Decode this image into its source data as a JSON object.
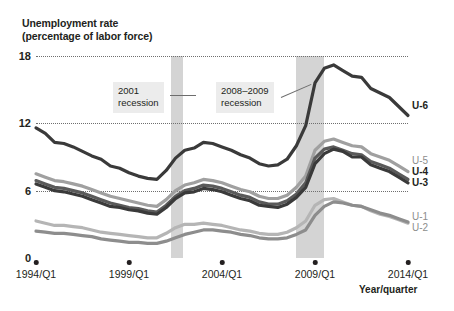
{
  "chart_data": {
    "type": "line",
    "title": "Unemployment rate",
    "subtitle": "(percentage of labor force)",
    "xlabel": "Year/quarter",
    "ylabel": "",
    "ylim": [
      0,
      18
    ],
    "yticks": [
      0,
      6,
      12,
      18
    ],
    "ytick_labels": [
      "0",
      "6",
      "12",
      "18"
    ],
    "grid": "horizontal-dotted",
    "legend_position": "right-inline",
    "xlim": [
      "1994/Q1",
      "2014/Q1"
    ],
    "xticks": [
      "1994/Q1",
      "1999/Q1",
      "2004/Q1",
      "2009/Q1",
      "2014/Q1"
    ],
    "x_start_year": 1994.0,
    "x_end_year": 2014.0,
    "annotations": [
      {
        "label_line1": "2001",
        "label_line2": "recession",
        "points_to": "2001 recession band"
      },
      {
        "label_line1": "2008–2009",
        "label_line2": "recession",
        "points_to": "2008-2009 recession band"
      }
    ],
    "recession_bands": [
      {
        "name": "2001 recession",
        "start_year": 2001.25,
        "end_year": 2001.9,
        "color": "#d4d4d4"
      },
      {
        "name": "2008-2009 recession",
        "start_year": 2008.0,
        "end_year": 2009.5,
        "color": "#d4d4d4"
      }
    ],
    "series": [
      {
        "name": "U-6",
        "label": "U-6",
        "color": "#3a3a3a",
        "label_style": "bold",
        "x": [
          1994.0,
          1994.5,
          1995.0,
          1995.5,
          1996.0,
          1996.5,
          1997.0,
          1997.5,
          1998.0,
          1998.5,
          1999.0,
          1999.5,
          2000.0,
          2000.5,
          2001.0,
          2001.5,
          2002.0,
          2002.5,
          2003.0,
          2003.5,
          2004.0,
          2004.5,
          2005.0,
          2005.5,
          2006.0,
          2006.5,
          2007.0,
          2007.5,
          2008.0,
          2008.5,
          2009.0,
          2009.5,
          2010.0,
          2010.5,
          2011.0,
          2011.5,
          2012.0,
          2012.5,
          2013.0,
          2013.5,
          2014.0
        ],
        "values": [
          11.6,
          11.1,
          10.3,
          10.2,
          9.9,
          9.5,
          9.1,
          8.8,
          8.2,
          8.0,
          7.6,
          7.3,
          7.1,
          7.0,
          7.8,
          8.9,
          9.6,
          9.8,
          10.3,
          10.2,
          9.9,
          9.6,
          9.2,
          8.9,
          8.4,
          8.2,
          8.3,
          8.8,
          10.0,
          11.8,
          15.6,
          16.9,
          17.2,
          16.7,
          16.2,
          16.1,
          15.1,
          14.7,
          14.3,
          13.5,
          12.7
        ],
        "endpoint_value": 12.6,
        "peak_value": 17.2,
        "peak_x": "2010/Q1",
        "min_value": 6.9
      },
      {
        "name": "U-5",
        "label": "U-5",
        "color": "#a0a0a0",
        "label_style": "gray",
        "x": [
          1994.0,
          1994.5,
          1995.0,
          1995.5,
          1996.0,
          1996.5,
          1997.0,
          1997.5,
          1998.0,
          1998.5,
          1999.0,
          1999.5,
          2000.0,
          2000.5,
          2001.0,
          2001.5,
          2002.0,
          2002.5,
          2003.0,
          2003.5,
          2004.0,
          2004.5,
          2005.0,
          2005.5,
          2006.0,
          2006.5,
          2007.0,
          2007.5,
          2008.0,
          2008.5,
          2009.0,
          2009.5,
          2010.0,
          2010.5,
          2011.0,
          2011.5,
          2012.0,
          2012.5,
          2013.0,
          2013.5,
          2014.0
        ],
        "values": [
          7.5,
          7.2,
          6.9,
          6.8,
          6.6,
          6.4,
          6.1,
          5.8,
          5.5,
          5.3,
          5.1,
          4.9,
          4.7,
          4.6,
          5.2,
          6.0,
          6.5,
          6.7,
          7.0,
          6.9,
          6.7,
          6.4,
          6.1,
          5.9,
          5.5,
          5.3,
          5.3,
          5.6,
          6.3,
          7.3,
          9.6,
          10.4,
          10.6,
          10.3,
          10.0,
          9.9,
          9.3,
          9.0,
          8.7,
          8.2,
          7.7
        ],
        "endpoint_value": 7.4
      },
      {
        "name": "U-4",
        "label": "U-4",
        "color": "#5a5a5a",
        "label_style": "bold",
        "x": [
          1994.0,
          1994.5,
          1995.0,
          1995.5,
          1996.0,
          1996.5,
          1997.0,
          1997.5,
          1998.0,
          1998.5,
          1999.0,
          1999.5,
          2000.0,
          2000.5,
          2001.0,
          2001.5,
          2002.0,
          2002.5,
          2003.0,
          2003.5,
          2004.0,
          2004.5,
          2005.0,
          2005.5,
          2006.0,
          2006.5,
          2007.0,
          2007.5,
          2008.0,
          2008.5,
          2009.0,
          2009.5,
          2010.0,
          2010.5,
          2011.0,
          2011.5,
          2012.0,
          2012.5,
          2013.0,
          2013.5,
          2014.0
        ],
        "values": [
          6.9,
          6.6,
          6.3,
          6.2,
          6.0,
          5.8,
          5.5,
          5.2,
          4.9,
          4.7,
          4.5,
          4.4,
          4.2,
          4.1,
          4.7,
          5.5,
          6.0,
          6.2,
          6.5,
          6.4,
          6.2,
          5.9,
          5.6,
          5.4,
          5.0,
          4.8,
          4.8,
          5.1,
          5.7,
          6.7,
          8.9,
          9.7,
          9.9,
          9.6,
          9.3,
          9.2,
          8.6,
          8.3,
          8.0,
          7.5,
          7.0
        ],
        "endpoint_value": 6.7
      },
      {
        "name": "U-3",
        "label": "U-3",
        "color": "#3a3a3a",
        "label_style": "bold",
        "x": [
          1994.0,
          1994.5,
          1995.0,
          1995.5,
          1996.0,
          1996.5,
          1997.0,
          1997.5,
          1998.0,
          1998.5,
          1999.0,
          1999.5,
          2000.0,
          2000.5,
          2001.0,
          2001.5,
          2002.0,
          2002.5,
          2003.0,
          2003.5,
          2004.0,
          2004.5,
          2005.0,
          2005.5,
          2006.0,
          2006.5,
          2007.0,
          2007.5,
          2008.0,
          2008.5,
          2009.0,
          2009.5,
          2010.0,
          2010.5,
          2011.0,
          2011.5,
          2012.0,
          2012.5,
          2013.0,
          2013.5,
          2014.0
        ],
        "values": [
          6.6,
          6.3,
          6.0,
          5.9,
          5.7,
          5.5,
          5.2,
          4.9,
          4.6,
          4.5,
          4.3,
          4.2,
          4.0,
          3.9,
          4.5,
          5.3,
          5.8,
          5.9,
          6.2,
          6.1,
          5.9,
          5.6,
          5.3,
          5.1,
          4.7,
          4.6,
          4.5,
          4.8,
          5.4,
          6.3,
          8.4,
          9.3,
          9.7,
          9.5,
          9.0,
          9.0,
          8.3,
          8.0,
          7.7,
          7.2,
          6.7
        ],
        "endpoint_value": 6.3
      },
      {
        "name": "U-1",
        "label": "U-1",
        "color": "#8d8d8d",
        "label_style": "gray",
        "x": [
          1994.0,
          1994.5,
          1995.0,
          1995.5,
          1996.0,
          1996.5,
          1997.0,
          1997.5,
          1998.0,
          1998.5,
          1999.0,
          1999.5,
          2000.0,
          2000.5,
          2001.0,
          2001.5,
          2002.0,
          2002.5,
          2003.0,
          2003.5,
          2004.0,
          2004.5,
          2005.0,
          2005.5,
          2006.0,
          2006.5,
          2007.0,
          2007.5,
          2008.0,
          2008.5,
          2009.0,
          2009.5,
          2010.0,
          2010.5,
          2011.0,
          2011.5,
          2012.0,
          2012.5,
          2013.0,
          2013.5,
          2014.0
        ],
        "values": [
          2.4,
          2.3,
          2.2,
          2.2,
          2.1,
          2.0,
          1.9,
          1.7,
          1.6,
          1.5,
          1.4,
          1.4,
          1.3,
          1.3,
          1.5,
          1.8,
          2.1,
          2.3,
          2.5,
          2.5,
          2.4,
          2.3,
          2.1,
          2.0,
          1.8,
          1.7,
          1.7,
          1.8,
          2.1,
          2.5,
          3.8,
          4.6,
          5.0,
          4.9,
          4.7,
          4.6,
          4.3,
          4.0,
          3.8,
          3.5,
          3.2
        ],
        "endpoint_value": 3.1
      },
      {
        "name": "U-2",
        "label": "U-2",
        "color": "#b5b5b5",
        "label_style": "gray",
        "x": [
          1994.0,
          1994.5,
          1995.0,
          1995.5,
          1996.0,
          1996.5,
          1997.0,
          1997.5,
          1998.0,
          1998.5,
          1999.0,
          1999.5,
          2000.0,
          2000.5,
          2001.0,
          2001.5,
          2002.0,
          2002.5,
          2003.0,
          2003.5,
          2004.0,
          2004.5,
          2005.0,
          2005.5,
          2006.0,
          2006.5,
          2007.0,
          2007.5,
          2008.0,
          2008.5,
          2009.0,
          2009.5,
          2010.0,
          2010.5,
          2011.0,
          2011.5,
          2012.0,
          2012.5,
          2013.0,
          2013.5,
          2014.0
        ],
        "values": [
          3.3,
          3.1,
          2.9,
          2.9,
          2.8,
          2.7,
          2.5,
          2.3,
          2.2,
          2.1,
          2.0,
          1.9,
          1.8,
          1.8,
          2.2,
          2.7,
          3.0,
          3.0,
          3.1,
          3.0,
          2.9,
          2.7,
          2.5,
          2.4,
          2.2,
          2.1,
          2.1,
          2.3,
          2.7,
          3.3,
          4.7,
          5.2,
          5.3,
          5.0,
          4.7,
          4.6,
          4.2,
          3.9,
          3.7,
          3.4,
          3.1
        ],
        "endpoint_value": 3.0
      }
    ]
  }
}
